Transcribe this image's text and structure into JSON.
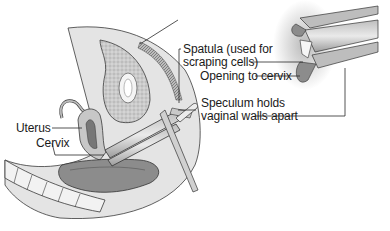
{
  "figure": {
    "type": "anatomical-illustration",
    "labels": {
      "uterus": "Uterus",
      "cervix": "Cervix",
      "spatula_line1": "Spatula (used for",
      "spatula_line2": "scraping cells)",
      "opening": "Opening to cervix",
      "speculum_line1": "Speculum holds",
      "speculum_line2": "vaginal walls apart"
    },
    "colors": {
      "background": "#ffffff",
      "tissue_light": "#d9d9d9",
      "tissue_mid": "#a8a8a8",
      "tissue_dark": "#6e6e6e",
      "outline": "#3a3a3a",
      "label_text": "#1a1a1a",
      "leader_line": "#2a2a2a"
    }
  }
}
